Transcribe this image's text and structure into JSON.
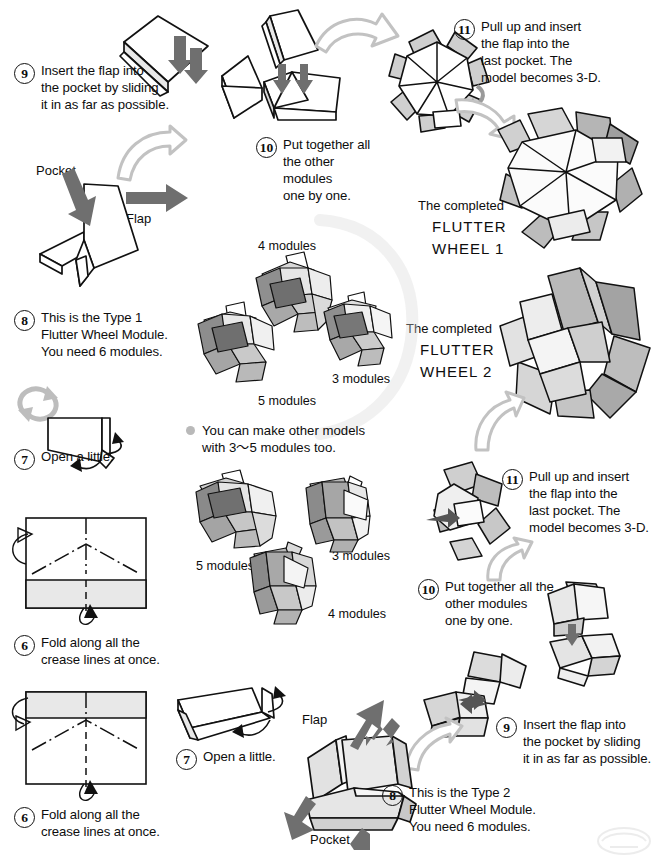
{
  "document": {
    "title": "Flutter Wheel modular origami assembly instructions",
    "watermark": "faint-logo-watermark"
  },
  "steps": {
    "left_9": {
      "number": "9",
      "text": "Insert the flap into\nthe pocket by sliding\nit in as far as possible."
    },
    "left_8": {
      "number": "8",
      "text": "This is the Type 1\nFlutter Wheel Module.\nYou need 6 modules."
    },
    "left_7": {
      "number": "7",
      "text": "Open a little."
    },
    "left_6a": {
      "number": "6",
      "text": "Fold along all the\ncrease lines at once."
    },
    "left_6b": {
      "number": "6",
      "text": "Fold along all the\ncrease lines at once."
    },
    "mid_10": {
      "number": "10",
      "text": "Put together all\nthe other modules\none by one."
    },
    "top_11": {
      "number": "11",
      "text": "Pull up and insert\nthe flap into the\nlast pocket.  The\nmodel becomes 3-D."
    },
    "right_11": {
      "number": "11",
      "text": "Pull up and insert\nthe flap into the\nlast pocket.  The\nmodel becomes 3-D."
    },
    "right_10": {
      "number": "10",
      "text": "Put together all the\nother modules\none by one."
    },
    "right_9": {
      "number": "9",
      "text": "Insert the flap into\nthe pocket by sliding\nit in as far as possible."
    },
    "right_8": {
      "number": "8",
      "text": "This is the Type 2\nFlutter Wheel Module.\nYou need 6 modules."
    },
    "bottom_7": {
      "number": "7",
      "text": "Open a little."
    }
  },
  "labels": {
    "pocket_left": "Pocket",
    "flap_left": "Flap",
    "flap_bottom": "Flap",
    "pocket_bottom": "Pocket"
  },
  "completed": {
    "wheel1": {
      "prefix": "The completed",
      "name1": "FLUTTER",
      "name2": "WHEEL 1"
    },
    "wheel2": {
      "prefix": "The completed",
      "name1": "FLUTTER",
      "name2": "WHEEL 2"
    }
  },
  "note": {
    "bullet": "bullet-dot",
    "text": "You can make other models\nwith 3～5 modules too."
  },
  "module_captions": {
    "group1": {
      "a": "4 modules",
      "b": "3 modules",
      "c": "5 modules"
    },
    "group2": {
      "a": "5 modules",
      "b": "3 modules",
      "c": "4 modules"
    }
  },
  "colors": {
    "ink": "#0d0d0d",
    "paper_white": "#ffffff",
    "paper_light": "#e8e8e8",
    "paper_mid": "#c9c9c9",
    "paper_dark": "#a6a6a6",
    "paper_darker": "#8a8a8a",
    "arrow_gray": "#b5b5b5",
    "arrow_solid": "#6f6f6f",
    "bullet_gray": "#b9b9b9"
  }
}
